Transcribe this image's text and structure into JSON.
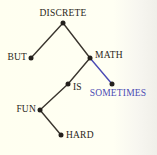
{
  "diagram": {
    "type": "tree-diagram",
    "background_color": "#fffef5",
    "default_node_color": "#24201c",
    "default_edge_color": "#3a352e",
    "accent_color": "#4b4bb4",
    "nodes": [
      {
        "id": "discrete",
        "label": "DISCRETE",
        "x": 63,
        "y": 23,
        "label_position": "above",
        "label_x": 63,
        "label_y": 18,
        "color": "#2a2620"
      },
      {
        "id": "but",
        "label": "BUT",
        "x": 31,
        "y": 58,
        "label_position": "left",
        "label_x": 27,
        "label_y": 58,
        "color": "#2a2620"
      },
      {
        "id": "math",
        "label": "MATH",
        "x": 90,
        "y": 58,
        "label_position": "right",
        "label_x": 95,
        "label_y": 56,
        "color": "#2a2620"
      },
      {
        "id": "is",
        "label": "IS",
        "x": 68,
        "y": 84,
        "label_position": "right",
        "label_x": 73,
        "label_y": 88,
        "color": "#2a2620"
      },
      {
        "id": "sometimes",
        "label": "SOMETIMES",
        "x": 112,
        "y": 84,
        "label_position": "below",
        "label_x": 118,
        "label_y": 89,
        "color": "#4b4bb4"
      },
      {
        "id": "fun",
        "label": "FUN",
        "x": 40,
        "y": 110,
        "label_position": "left",
        "label_x": 36,
        "label_y": 110,
        "color": "#2a2620"
      },
      {
        "id": "hard",
        "label": "HARD",
        "x": 61,
        "y": 135,
        "label_position": "right",
        "label_x": 66,
        "label_y": 136,
        "color": "#2a2620"
      }
    ],
    "edges": [
      {
        "id": "edge-discrete-but",
        "from": "discrete",
        "to": "but",
        "x1": 63,
        "y1": 23,
        "x2": 31,
        "y2": 58,
        "color": "#3a352e"
      },
      {
        "id": "edge-discrete-math",
        "from": "discrete",
        "to": "math",
        "x1": 63,
        "y1": 23,
        "x2": 90,
        "y2": 58,
        "color": "#3a352e"
      },
      {
        "id": "edge-math-is",
        "from": "math",
        "to": "is",
        "x1": 90,
        "y1": 58,
        "x2": 68,
        "y2": 84,
        "color": "#3a352e"
      },
      {
        "id": "edge-math-sometimes",
        "from": "math",
        "to": "sometimes",
        "x1": 90,
        "y1": 58,
        "x2": 112,
        "y2": 84,
        "color": "#4b4bb4"
      },
      {
        "id": "edge-is-fun",
        "from": "is",
        "to": "fun",
        "x1": 68,
        "y1": 84,
        "x2": 40,
        "y2": 110,
        "color": "#3a352e"
      },
      {
        "id": "edge-fun-hard",
        "from": "fun",
        "to": "hard",
        "x1": 40,
        "y1": 110,
        "x2": 61,
        "y2": 135,
        "color": "#3a352e"
      }
    ]
  }
}
